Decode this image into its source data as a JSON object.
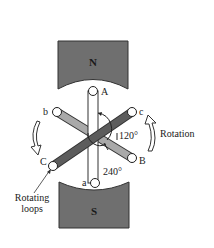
{
  "diagram": {
    "magnets": {
      "north": "N",
      "south": "S"
    },
    "coil_ends": {
      "A": "A",
      "a": "a",
      "B": "B",
      "b": "b",
      "C": "C",
      "c": "c"
    },
    "angles": {
      "first": "120°",
      "second": "240°"
    },
    "labels": {
      "rotation": "Rotation",
      "rotating_loops_line1": "Rotating",
      "rotating_loops_line2": "loops"
    },
    "colors": {
      "magnet": "#707070",
      "coil_light": "#a8a8a8",
      "coil_dark": "#5e5e5e"
    }
  }
}
